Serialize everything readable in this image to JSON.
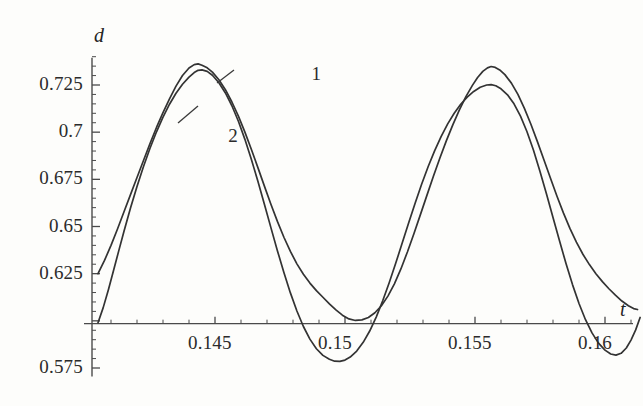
{
  "figure": {
    "background_color": "#fdfdfb",
    "ink_color": "#333333",
    "axis_color": "#4a4a4a"
  },
  "chart_data": {
    "type": "line",
    "title": "",
    "xlabel": "t",
    "ylabel": "d",
    "xlim": [
      0.1405,
      0.1613
    ],
    "ylim": [
      0.5705,
      0.7415
    ],
    "grid": false,
    "legend_position": "inline-annotations",
    "axis_crossing_y": 0.5985,
    "xticks_major": [
      0.145,
      0.15,
      0.155,
      0.16
    ],
    "xtick_labels": [
      "0.145",
      "0.15",
      "0.155",
      "0.16"
    ],
    "xtick_minor_step": 0.001,
    "yticks_major": [
      0.575,
      0.6,
      0.625,
      0.65,
      0.675,
      0.7,
      0.725
    ],
    "ytick_labels": [
      "0.575",
      "",
      "0.625",
      "0.65",
      "0.675",
      "0.7",
      "0.725"
    ],
    "ytick_minor_step": 0.005,
    "annotations": [
      {
        "text": "1",
        "x": 0.1489,
        "y": 0.7298
      },
      {
        "text": "2",
        "x": 0.1457,
        "y": 0.6968
      }
    ],
    "series": [
      {
        "name": "1",
        "label": "1",
        "peak_value": 0.7362,
        "trough_value": 0.6002,
        "period": 0.0105,
        "points": [
          [
            0.1405,
            0.625
          ],
          [
            0.14075,
            0.632
          ],
          [
            0.141,
            0.64
          ],
          [
            0.14125,
            0.6487
          ],
          [
            0.1415,
            0.6578
          ],
          [
            0.14175,
            0.6669
          ],
          [
            0.142,
            0.676
          ],
          [
            0.14225,
            0.685
          ],
          [
            0.1425,
            0.6939
          ],
          [
            0.14275,
            0.7025
          ],
          [
            0.143,
            0.7104
          ],
          [
            0.14325,
            0.7177
          ],
          [
            0.1435,
            0.7244
          ],
          [
            0.14375,
            0.73
          ],
          [
            0.144,
            0.734
          ],
          [
            0.1442,
            0.7358
          ],
          [
            0.14435,
            0.7362
          ],
          [
            0.1445,
            0.7355
          ],
          [
            0.1447,
            0.7341
          ],
          [
            0.1449,
            0.7318
          ],
          [
            0.14515,
            0.7278
          ],
          [
            0.1454,
            0.7225
          ],
          [
            0.14565,
            0.716
          ],
          [
            0.1459,
            0.7085
          ],
          [
            0.14615,
            0.7
          ],
          [
            0.1464,
            0.6908
          ],
          [
            0.14665,
            0.6812
          ],
          [
            0.1469,
            0.6714
          ],
          [
            0.14715,
            0.6618
          ],
          [
            0.1474,
            0.6527
          ],
          [
            0.14765,
            0.6443
          ],
          [
            0.1479,
            0.6368
          ],
          [
            0.14815,
            0.6302
          ],
          [
            0.1484,
            0.6247
          ],
          [
            0.14865,
            0.62
          ],
          [
            0.1489,
            0.616
          ],
          [
            0.14915,
            0.6125
          ],
          [
            0.1494,
            0.609
          ],
          [
            0.14965,
            0.6058
          ],
          [
            0.1499,
            0.603
          ],
          [
            0.15015,
            0.601
          ],
          [
            0.1504,
            0.6002
          ],
          [
            0.15065,
            0.6005
          ],
          [
            0.1509,
            0.6018
          ],
          [
            0.15115,
            0.6043
          ],
          [
            0.1514,
            0.608
          ],
          [
            0.15165,
            0.6131
          ],
          [
            0.1519,
            0.6196
          ],
          [
            0.15215,
            0.6275
          ],
          [
            0.1524,
            0.6365
          ],
          [
            0.15265,
            0.6462
          ],
          [
            0.1529,
            0.6563
          ],
          [
            0.15315,
            0.6665
          ],
          [
            0.1534,
            0.6766
          ],
          [
            0.15365,
            0.6863
          ],
          [
            0.1539,
            0.6955
          ],
          [
            0.15415,
            0.704
          ],
          [
            0.1544,
            0.7118
          ],
          [
            0.15465,
            0.7188
          ],
          [
            0.1549,
            0.7248
          ],
          [
            0.1551,
            0.729
          ],
          [
            0.1553,
            0.7322
          ],
          [
            0.15548,
            0.7341
          ],
          [
            0.15562,
            0.7348
          ],
          [
            0.15578,
            0.7343
          ],
          [
            0.15595,
            0.733
          ],
          [
            0.15615,
            0.7305
          ],
          [
            0.1564,
            0.726
          ],
          [
            0.15665,
            0.72
          ],
          [
            0.1569,
            0.7126
          ],
          [
            0.15715,
            0.7042
          ],
          [
            0.1574,
            0.695
          ],
          [
            0.15765,
            0.6854
          ],
          [
            0.1579,
            0.6757
          ],
          [
            0.15815,
            0.6662
          ],
          [
            0.1584,
            0.6572
          ],
          [
            0.15865,
            0.649
          ],
          [
            0.1589,
            0.6417
          ],
          [
            0.15915,
            0.6353
          ],
          [
            0.1594,
            0.6298
          ],
          [
            0.15965,
            0.625
          ],
          [
            0.1599,
            0.6208
          ],
          [
            0.16015,
            0.617
          ],
          [
            0.1604,
            0.6136
          ],
          [
            0.16065,
            0.6105
          ],
          [
            0.1609,
            0.608
          ],
          [
            0.1611,
            0.6065
          ],
          [
            0.16125,
            0.606
          ]
        ]
      },
      {
        "name": "2",
        "label": "2",
        "peak_value": 0.733,
        "trough_value": 0.5785,
        "period": 0.0105,
        "points": [
          [
            0.1405,
            0.599
          ],
          [
            0.1407,
            0.607
          ],
          [
            0.1409,
            0.6165
          ],
          [
            0.1411,
            0.6268
          ],
          [
            0.1413,
            0.6372
          ],
          [
            0.1415,
            0.6475
          ],
          [
            0.14175,
            0.6598
          ],
          [
            0.142,
            0.6712
          ],
          [
            0.14225,
            0.6818
          ],
          [
            0.1425,
            0.6915
          ],
          [
            0.14275,
            0.7002
          ],
          [
            0.143,
            0.708
          ],
          [
            0.14325,
            0.7148
          ],
          [
            0.1435,
            0.7206
          ],
          [
            0.14375,
            0.7254
          ],
          [
            0.144,
            0.7292
          ],
          [
            0.1442,
            0.7316
          ],
          [
            0.14435,
            0.7328
          ],
          [
            0.1445,
            0.733
          ],
          [
            0.1447,
            0.7322
          ],
          [
            0.1449,
            0.7302
          ],
          [
            0.14515,
            0.7262
          ],
          [
            0.1454,
            0.7208
          ],
          [
            0.14565,
            0.714
          ],
          [
            0.1459,
            0.7058
          ],
          [
            0.14615,
            0.6962
          ],
          [
            0.1464,
            0.6855
          ],
          [
            0.14665,
            0.674
          ],
          [
            0.1469,
            0.6618
          ],
          [
            0.14715,
            0.6494
          ],
          [
            0.1474,
            0.6372
          ],
          [
            0.14765,
            0.6256
          ],
          [
            0.1479,
            0.6148
          ],
          [
            0.14815,
            0.6052
          ],
          [
            0.1484,
            0.597
          ],
          [
            0.14865,
            0.5903
          ],
          [
            0.1489,
            0.5852
          ],
          [
            0.14915,
            0.5817
          ],
          [
            0.1494,
            0.5796
          ],
          [
            0.1496,
            0.5786
          ],
          [
            0.1498,
            0.5785
          ],
          [
            0.15,
            0.5792
          ],
          [
            0.1502,
            0.5808
          ],
          [
            0.15045,
            0.584
          ],
          [
            0.1507,
            0.5886
          ],
          [
            0.15095,
            0.5946
          ],
          [
            0.1512,
            0.602
          ],
          [
            0.15145,
            0.6106
          ],
          [
            0.1517,
            0.6202
          ],
          [
            0.15195,
            0.6305
          ],
          [
            0.1522,
            0.6412
          ],
          [
            0.15245,
            0.652
          ],
          [
            0.1527,
            0.6625
          ],
          [
            0.15295,
            0.6725
          ],
          [
            0.1532,
            0.6818
          ],
          [
            0.15345,
            0.6902
          ],
          [
            0.1537,
            0.6978
          ],
          [
            0.15395,
            0.7044
          ],
          [
            0.1542,
            0.71
          ],
          [
            0.15445,
            0.7148
          ],
          [
            0.1547,
            0.7186
          ],
          [
            0.15495,
            0.7216
          ],
          [
            0.1552,
            0.7238
          ],
          [
            0.15545,
            0.725
          ],
          [
            0.15562,
            0.7252
          ],
          [
            0.1558,
            0.7246
          ],
          [
            0.156,
            0.723
          ],
          [
            0.15625,
            0.7198
          ],
          [
            0.1565,
            0.715
          ],
          [
            0.15675,
            0.7085
          ],
          [
            0.157,
            0.7002
          ],
          [
            0.15725,
            0.6904
          ],
          [
            0.1575,
            0.6792
          ],
          [
            0.15775,
            0.6672
          ],
          [
            0.158,
            0.6548
          ],
          [
            0.15825,
            0.6424
          ],
          [
            0.1585,
            0.6304
          ],
          [
            0.15875,
            0.6192
          ],
          [
            0.159,
            0.6092
          ],
          [
            0.15925,
            0.6006
          ],
          [
            0.1595,
            0.5936
          ],
          [
            0.15975,
            0.5882
          ],
          [
            0.16,
            0.5845
          ],
          [
            0.16022,
            0.5824
          ],
          [
            0.16042,
            0.5818
          ],
          [
            0.16062,
            0.5828
          ],
          [
            0.16082,
            0.5856
          ],
          [
            0.161,
            0.5898
          ],
          [
            0.16118,
            0.5952
          ],
          [
            0.16135,
            0.6018
          ]
        ]
      }
    ]
  }
}
